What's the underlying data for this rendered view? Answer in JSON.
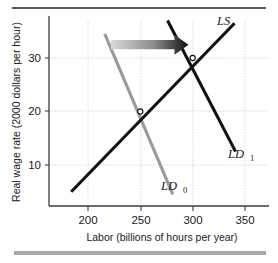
{
  "figure": {
    "background_color": "#ffffff",
    "top_rule_color": "#5a5a5a",
    "bottom_bar_color": "#a8a8a8"
  },
  "chart_data": {
    "type": "line",
    "title": "",
    "xlabel": "Labor (billions of hours per year)",
    "ylabel": "Real wage rate (2000 dollars per hour)",
    "xlim": [
      175,
      355
    ],
    "ylim": [
      0,
      37
    ],
    "xticks": [
      "200",
      "250",
      "300",
      "350"
    ],
    "xtick_values": [
      200,
      250,
      300,
      350
    ],
    "yticks": [
      "10",
      "20",
      "30"
    ],
    "ytick_values": [
      10,
      20,
      30
    ],
    "grid": true,
    "legend_position": "inline-labels",
    "series": [
      {
        "name": "LS",
        "label": "LS",
        "label_base": "LS",
        "label_sub": "",
        "color": "#111111",
        "kind": "supply",
        "points": [
          {
            "x": 184,
            "y": 5.0
          },
          {
            "x": 340,
            "y": 36.5
          }
        ]
      },
      {
        "name": "LD0",
        "label": "LD0",
        "label_base": "LD",
        "label_sub": "0",
        "color": "#9a9a9a",
        "kind": "demand",
        "points": [
          {
            "x": 216,
            "y": 34.5
          },
          {
            "x": 281,
            "y": 4.5
          }
        ]
      },
      {
        "name": "LD1",
        "label": "LD1",
        "label_base": "LD",
        "label_sub": "1",
        "color": "#111111",
        "kind": "demand",
        "points": [
          {
            "x": 276,
            "y": 37.0
          },
          {
            "x": 341,
            "y": 12.5
          }
        ]
      }
    ],
    "equilibria": [
      {
        "name": "initial-equilibrium",
        "x": 250,
        "y": 20
      },
      {
        "name": "new-equilibrium",
        "x": 300,
        "y": 30
      }
    ],
    "annotations": [
      {
        "name": "shift-arrow",
        "kind": "arrow",
        "direction": "right",
        "from_x": 222,
        "to_x": 296,
        "at_y": 32.5,
        "gradient_from": "#d8d8d8",
        "gradient_to": "#111111"
      }
    ]
  }
}
